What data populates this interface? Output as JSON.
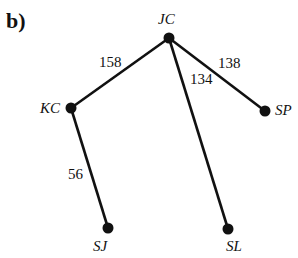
{
  "panel_label": "b)",
  "nodes": [
    {
      "id": "JC",
      "label": "JC",
      "x": 169,
      "y": 38
    },
    {
      "id": "KC",
      "label": "KC",
      "x": 71,
      "y": 108
    },
    {
      "id": "SP",
      "label": "SP",
      "x": 265,
      "y": 111
    },
    {
      "id": "SJ",
      "label": "SJ",
      "x": 108,
      "y": 228
    },
    {
      "id": "SL",
      "label": "SL",
      "x": 228,
      "y": 229
    }
  ],
  "edges": [
    {
      "from": "JC",
      "to": "KC",
      "weight": "158"
    },
    {
      "from": "JC",
      "to": "SL",
      "weight": "134"
    },
    {
      "from": "JC",
      "to": "SP",
      "weight": "138"
    },
    {
      "from": "KC",
      "to": "SJ",
      "weight": "56"
    }
  ]
}
